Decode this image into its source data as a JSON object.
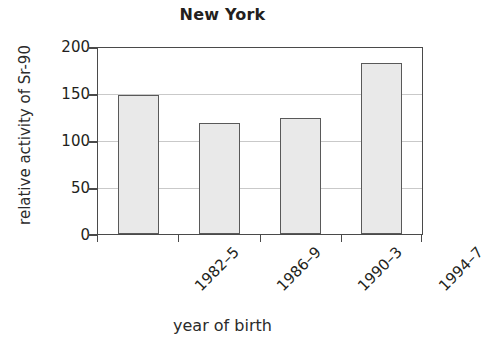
{
  "chart_data": {
    "type": "bar",
    "title": "New York",
    "xlabel": "year of birth",
    "ylabel": "relative activity of Sr-90",
    "categories": [
      "1982–5",
      "1986–9",
      "1990–3",
      "1994–7"
    ],
    "values": [
      150,
      119,
      125,
      184
    ],
    "yticks": [
      0,
      50,
      100,
      150,
      200
    ],
    "ylim": [
      0,
      200
    ],
    "grid": "horizontal",
    "legend": "none",
    "colors": {
      "bar_fill": "#e9e9e9",
      "bar_edge": "#595959",
      "axis": "#4a4a4a",
      "gridline": "#c9c9c9",
      "text": "#231f20",
      "background": "#ffffff"
    }
  },
  "ytick_labels": [
    "200",
    "150",
    "100",
    "50",
    "0"
  ]
}
